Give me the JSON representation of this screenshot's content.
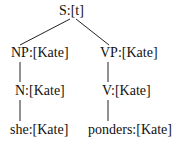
{
  "tree": {
    "root": {
      "label": "S:[t]"
    },
    "np": {
      "label": "NP:[Kate]"
    },
    "vp": {
      "label": "VP:[Kate]"
    },
    "n": {
      "label": "N:[Kate]"
    },
    "v": {
      "label": "V:[Kate]"
    },
    "she": {
      "label": "she:[Kate]"
    },
    "ponders": {
      "label": "ponders:[Kate]"
    }
  },
  "colors": {
    "line": "#222222",
    "text": "#111111",
    "background": "#ffffff"
  }
}
